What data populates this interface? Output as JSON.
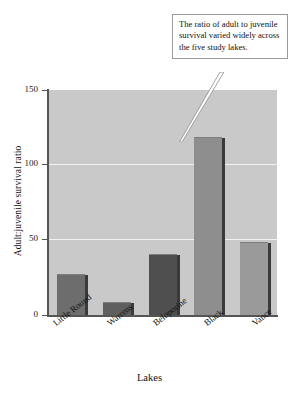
{
  "chart_data": {
    "type": "bar",
    "title": "",
    "categories": [
      "Little Round",
      "Warrens",
      "Beloporine",
      "Black",
      "Vance"
    ],
    "values": [
      27,
      8,
      40,
      118,
      48
    ],
    "xlabel": "Lakes",
    "ylabel": "Adult:juvenile survival ratio",
    "ylim": [
      0,
      150
    ],
    "yticks": [
      0,
      50,
      100,
      150
    ],
    "ytick_labels": [
      "0",
      "50",
      "100",
      "150"
    ],
    "gridlines": [
      50,
      100
    ],
    "grid": true,
    "legend": null,
    "bar_colors": [
      "#6d6d6d",
      "#5f5f5f",
      "#4f4f4f",
      "#8e8e8e",
      "#9a9a9a"
    ],
    "plot_background": "#c9c9c9",
    "gridline_color": "#f2f2f2",
    "annotations": [
      {
        "text": "The ratio of adult to juvenile survival varied widely across the five study lakes.",
        "points_to_category": "Black"
      }
    ]
  },
  "axes": {
    "y_title": "Adult:juvenile survival ratio",
    "x_title": "Lakes",
    "ticks": [
      {
        "label": "150",
        "value": 150
      },
      {
        "label": "100",
        "value": 100
      },
      {
        "label": "50",
        "value": 50
      },
      {
        "label": "0",
        "value": 0
      }
    ]
  },
  "callout": {
    "text": "The ratio of adult to juvenile survival varied widely across the five study lakes."
  }
}
